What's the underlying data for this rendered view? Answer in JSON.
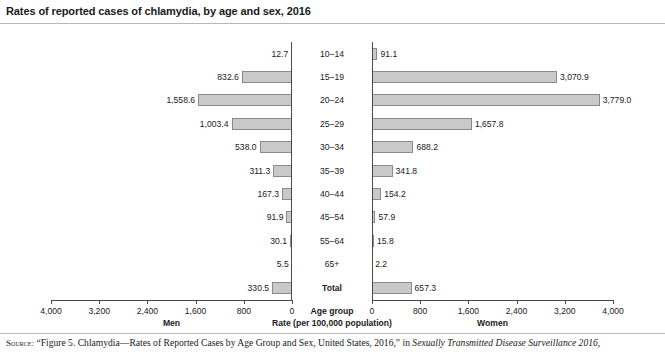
{
  "title": "Rates of reported cases of chlamydia, by age and sex, 2016",
  "axes": {
    "center_header": "Age group",
    "rate_label": "Rate (per 100,000 population)",
    "left_name": "Men",
    "right_name": "Women",
    "left_ticks": [
      "4,000",
      "3,200",
      "2,400",
      "1,600",
      "800",
      "0"
    ],
    "right_ticks": [
      "0",
      "800",
      "1,600",
      "2,400",
      "3,200",
      "4,000"
    ],
    "max": 4000
  },
  "source": {
    "prefix": "Source:",
    "text": " “Figure 5. Chlamydia—Rates of Reported Cases by Age Group and Sex, United States, 2016,” in ",
    "publication": "Sexually Transmitted Disease Surveillance 2016,"
  },
  "colors": {
    "bar_fill": "#c9c9c9",
    "bar_border": "#8a8a8a",
    "axis": "#4a4a4a",
    "text": "#1a1a1a"
  },
  "chart_data": {
    "type": "bar",
    "title": "Rates of reported cases of chlamydia, by age and sex, 2016",
    "subtitle": "",
    "xlabel": "Rate (per 100,000 population)",
    "ylabel": "Age group",
    "orientation": "horizontal",
    "layout": "back-to-back population pyramid",
    "xlim": [
      0,
      4000
    ],
    "grid": false,
    "legend": "none (left panel = Men, right panel = Women)",
    "categories": [
      "10–14",
      "15–19",
      "20–24",
      "25–29",
      "30–34",
      "35–39",
      "40–44",
      "45–54",
      "55–64",
      "65+",
      "Total"
    ],
    "series": [
      {
        "name": "Men",
        "side": "left",
        "values": [
          12.7,
          832.6,
          1558.6,
          1003.4,
          538.0,
          311.3,
          167.3,
          91.9,
          30.1,
          5.5,
          330.5
        ],
        "labels": [
          "12.7",
          "832.6",
          "1,558.6",
          "1,003.4",
          "538.0",
          "311.3",
          "167.3",
          "91.9",
          "30.1",
          "5.5",
          "330.5"
        ]
      },
      {
        "name": "Women",
        "side": "right",
        "values": [
          91.1,
          3070.9,
          3779.0,
          1657.8,
          688.2,
          341.8,
          154.2,
          57.9,
          15.8,
          2.2,
          657.3
        ],
        "labels": [
          "91.1",
          "3,070.9",
          "3,779.0",
          "1,657.8",
          "688.2",
          "341.8",
          "154.2",
          "57.9",
          "15.8",
          "2.2",
          "657.3"
        ]
      }
    ]
  }
}
